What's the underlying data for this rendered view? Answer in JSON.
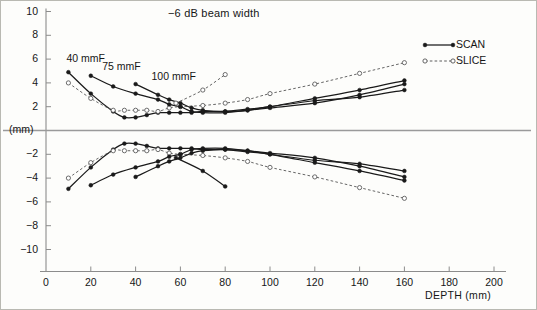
{
  "chart_data": {
    "type": "line",
    "title": "−6 dB beam width",
    "xlabel": "DEPTH (mm)",
    "ylabel": "(mm)",
    "xlim": [
      0,
      200
    ],
    "ylim": [
      -10,
      10
    ],
    "xticks": [
      0,
      20,
      40,
      60,
      80,
      100,
      120,
      140,
      160,
      180,
      200
    ],
    "yticks": [
      10,
      8,
      6,
      4,
      2,
      -2,
      -4,
      -6,
      -8,
      -10
    ],
    "ytick_labels": [
      "10",
      "8",
      "6",
      "4",
      "2",
      "−2",
      "−4",
      "−6",
      "−8",
      "−10"
    ],
    "xtick_labels": [
      "0",
      "20",
      "40",
      "60",
      "80",
      "100",
      "120",
      "140",
      "160",
      "180",
      "200"
    ],
    "grid": false,
    "zero_line": true,
    "legend_position": "top-right",
    "legend": [
      {
        "name": "SCAN",
        "style": "solid",
        "marker": "filled-circle",
        "color": "#1a1a1a"
      },
      {
        "name": "SLICE",
        "style": "dashed",
        "marker": "open-circle",
        "color": "#4a4a4a"
      }
    ],
    "annotations": [
      {
        "text": "40 mmF",
        "x": 10,
        "y": 6.0
      },
      {
        "text": "75 mmF",
        "x": 26,
        "y": 5.3
      },
      {
        "text": "100 mmF",
        "x": 48,
        "y": 4.5
      }
    ],
    "series": [
      {
        "name": "40 mmF SCAN",
        "focus": "40 mmF",
        "mode": "SCAN",
        "half": "upper",
        "style": "solid",
        "marker": "filled-circle",
        "points": [
          {
            "x": 10,
            "y": 4.9
          },
          {
            "x": 20,
            "y": 3.1
          },
          {
            "x": 30,
            "y": 1.6
          },
          {
            "x": 35,
            "y": 1.1
          },
          {
            "x": 40,
            "y": 1.1
          },
          {
            "x": 45,
            "y": 1.3
          },
          {
            "x": 50,
            "y": 1.5
          },
          {
            "x": 55,
            "y": 1.5
          },
          {
            "x": 60,
            "y": 1.5
          },
          {
            "x": 65,
            "y": 1.5
          },
          {
            "x": 70,
            "y": 1.6
          },
          {
            "x": 80,
            "y": 1.6
          },
          {
            "x": 90,
            "y": 1.7
          },
          {
            "x": 100,
            "y": 2.0
          },
          {
            "x": 120,
            "y": 2.5
          },
          {
            "x": 140,
            "y": 2.8
          },
          {
            "x": 160,
            "y": 3.4
          }
        ]
      },
      {
        "name": "40 mmF SLICE",
        "focus": "40 mmF",
        "mode": "SLICE",
        "half": "upper",
        "style": "dashed",
        "marker": "open-circle",
        "points": [
          {
            "x": 10,
            "y": 4.0
          },
          {
            "x": 20,
            "y": 2.7
          },
          {
            "x": 30,
            "y": 1.7
          },
          {
            "x": 35,
            "y": 1.7
          },
          {
            "x": 40,
            "y": 1.7
          },
          {
            "x": 45,
            "y": 1.7
          },
          {
            "x": 50,
            "y": 1.6
          },
          {
            "x": 55,
            "y": 1.9
          },
          {
            "x": 60,
            "y": 2.0
          },
          {
            "x": 70,
            "y": 2.1
          },
          {
            "x": 80,
            "y": 2.3
          },
          {
            "x": 90,
            "y": 2.6
          },
          {
            "x": 100,
            "y": 3.1
          },
          {
            "x": 120,
            "y": 3.9
          },
          {
            "x": 140,
            "y": 4.8
          },
          {
            "x": 160,
            "y": 5.7
          }
        ]
      },
      {
        "name": "75 mmF SCAN",
        "focus": "75 mmF",
        "mode": "SCAN",
        "half": "upper",
        "style": "solid",
        "marker": "filled-circle",
        "points": [
          {
            "x": 20,
            "y": 4.6
          },
          {
            "x": 30,
            "y": 3.7
          },
          {
            "x": 40,
            "y": 3.1
          },
          {
            "x": 50,
            "y": 2.6
          },
          {
            "x": 55,
            "y": 2.2
          },
          {
            "x": 60,
            "y": 2.0
          },
          {
            "x": 65,
            "y": 1.6
          },
          {
            "x": 70,
            "y": 1.5
          },
          {
            "x": 80,
            "y": 1.5
          },
          {
            "x": 90,
            "y": 1.7
          },
          {
            "x": 100,
            "y": 1.9
          },
          {
            "x": 120,
            "y": 2.3
          },
          {
            "x": 140,
            "y": 3.0
          },
          {
            "x": 160,
            "y": 3.9
          }
        ]
      },
      {
        "name": "100 mmF SCAN",
        "focus": "100 mmF",
        "mode": "SCAN",
        "half": "upper",
        "style": "solid",
        "marker": "filled-circle",
        "points": [
          {
            "x": 40,
            "y": 3.9
          },
          {
            "x": 50,
            "y": 3.0
          },
          {
            "x": 55,
            "y": 2.6
          },
          {
            "x": 60,
            "y": 2.3
          },
          {
            "x": 65,
            "y": 1.9
          },
          {
            "x": 70,
            "y": 1.7
          },
          {
            "x": 80,
            "y": 1.6
          },
          {
            "x": 90,
            "y": 1.8
          },
          {
            "x": 100,
            "y": 2.0
          },
          {
            "x": 120,
            "y": 2.7
          },
          {
            "x": 140,
            "y": 3.4
          },
          {
            "x": 160,
            "y": 4.2
          }
        ]
      },
      {
        "name": "100 mmF SLICE",
        "focus": "100 mmF",
        "mode": "SLICE",
        "half": "upper",
        "style": "dashed",
        "marker": "open-circle",
        "points": [
          {
            "x": 58,
            "y": 2.3
          },
          {
            "x": 70,
            "y": 3.4
          },
          {
            "x": 80,
            "y": 4.7
          }
        ]
      },
      {
        "name": "40 mmF SCAN (mirror)",
        "focus": "40 mmF",
        "mode": "SCAN",
        "half": "lower",
        "style": "solid",
        "marker": "filled-circle",
        "points": [
          {
            "x": 10,
            "y": -4.9
          },
          {
            "x": 20,
            "y": -3.1
          },
          {
            "x": 30,
            "y": -1.6
          },
          {
            "x": 35,
            "y": -1.1
          },
          {
            "x": 40,
            "y": -1.1
          },
          {
            "x": 45,
            "y": -1.3
          },
          {
            "x": 50,
            "y": -1.5
          },
          {
            "x": 55,
            "y": -1.5
          },
          {
            "x": 60,
            "y": -1.5
          },
          {
            "x": 65,
            "y": -1.5
          },
          {
            "x": 70,
            "y": -1.6
          },
          {
            "x": 80,
            "y": -1.6
          },
          {
            "x": 90,
            "y": -1.7
          },
          {
            "x": 100,
            "y": -2.0
          },
          {
            "x": 120,
            "y": -2.5
          },
          {
            "x": 140,
            "y": -2.8
          },
          {
            "x": 160,
            "y": -3.4
          }
        ]
      },
      {
        "name": "40 mmF SLICE (mirror)",
        "focus": "40 mmF",
        "mode": "SLICE",
        "half": "lower",
        "style": "dashed",
        "marker": "open-circle",
        "points": [
          {
            "x": 10,
            "y": -4.0
          },
          {
            "x": 20,
            "y": -2.7
          },
          {
            "x": 30,
            "y": -1.7
          },
          {
            "x": 35,
            "y": -1.7
          },
          {
            "x": 40,
            "y": -1.7
          },
          {
            "x": 45,
            "y": -1.7
          },
          {
            "x": 50,
            "y": -1.6
          },
          {
            "x": 55,
            "y": -1.9
          },
          {
            "x": 60,
            "y": -2.0
          },
          {
            "x": 70,
            "y": -2.1
          },
          {
            "x": 80,
            "y": -2.3
          },
          {
            "x": 90,
            "y": -2.6
          },
          {
            "x": 100,
            "y": -3.1
          },
          {
            "x": 120,
            "y": -3.9
          },
          {
            "x": 140,
            "y": -4.8
          },
          {
            "x": 160,
            "y": -5.7
          }
        ]
      },
      {
        "name": "75 mmF SCAN (mirror)",
        "focus": "75 mmF",
        "mode": "SCAN",
        "half": "lower",
        "style": "solid",
        "marker": "filled-circle",
        "points": [
          {
            "x": 20,
            "y": -4.6
          },
          {
            "x": 30,
            "y": -3.7
          },
          {
            "x": 40,
            "y": -3.1
          },
          {
            "x": 50,
            "y": -2.6
          },
          {
            "x": 55,
            "y": -2.2
          },
          {
            "x": 60,
            "y": -2.0
          },
          {
            "x": 65,
            "y": -1.6
          },
          {
            "x": 70,
            "y": -1.5
          },
          {
            "x": 80,
            "y": -1.5
          },
          {
            "x": 90,
            "y": -1.7
          },
          {
            "x": 100,
            "y": -1.9
          },
          {
            "x": 120,
            "y": -2.3
          },
          {
            "x": 140,
            "y": -3.0
          },
          {
            "x": 160,
            "y": -3.9
          }
        ]
      },
      {
        "name": "100 mmF SCAN (mirror)",
        "focus": "100 mmF",
        "mode": "SCAN",
        "half": "lower",
        "style": "solid",
        "marker": "filled-circle",
        "points": [
          {
            "x": 40,
            "y": -3.9
          },
          {
            "x": 50,
            "y": -3.0
          },
          {
            "x": 55,
            "y": -2.6
          },
          {
            "x": 60,
            "y": -2.3
          },
          {
            "x": 65,
            "y": -1.9
          },
          {
            "x": 70,
            "y": -1.7
          },
          {
            "x": 80,
            "y": -1.6
          },
          {
            "x": 90,
            "y": -1.8
          },
          {
            "x": 100,
            "y": -2.0
          },
          {
            "x": 120,
            "y": -2.7
          },
          {
            "x": 140,
            "y": -3.4
          },
          {
            "x": 160,
            "y": -4.2
          }
        ]
      },
      {
        "name": "100 mmF SCAN (mirror descending)",
        "focus": "100 mmF",
        "mode": "SCAN",
        "half": "lower",
        "style": "solid",
        "marker": "filled-circle",
        "points": [
          {
            "x": 58,
            "y": -2.3
          },
          {
            "x": 70,
            "y": -3.4
          },
          {
            "x": 80,
            "y": -4.7
          }
        ]
      }
    ]
  },
  "colors": {
    "scan": "#1a1a1a",
    "slice": "#555555",
    "axis": "#8c8c8c",
    "zero_line": "#9a9a9a",
    "text": "#161616",
    "background": "#fdfdfb",
    "border": "#b9b9b2"
  }
}
